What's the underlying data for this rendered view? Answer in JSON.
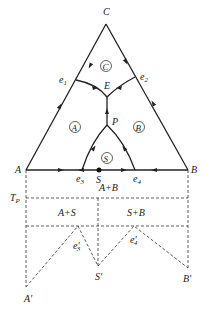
{
  "diagram": {
    "type": "ternary-phase-diagram-with-binary-section",
    "vertices": {
      "top": "C",
      "left": "A",
      "right": "B"
    },
    "points": {
      "e1": "e",
      "e1_sub": "1",
      "e2": "e",
      "e2_sub": "2",
      "e3": "e",
      "e3_sub": "3",
      "e4": "e",
      "e4_sub": "4",
      "E": "E",
      "P": "P",
      "S": "S"
    },
    "regions": {
      "C": "C",
      "A": "A",
      "B": "B",
      "S": "S"
    },
    "section": {
      "liquid_region_label": "A+B",
      "tp_label": "T",
      "tp_sub": "P",
      "left_region_label": "A+S",
      "right_region_label": "S+B",
      "e3_prime": "e",
      "e3_prime_sub": "3",
      "e3_prime_mark": "′",
      "e4_prime": "e",
      "e4_prime_sub": "4",
      "e4_prime_mark": "′",
      "A_prime": "A′",
      "S_prime": "S′",
      "B_prime": "B′"
    }
  }
}
